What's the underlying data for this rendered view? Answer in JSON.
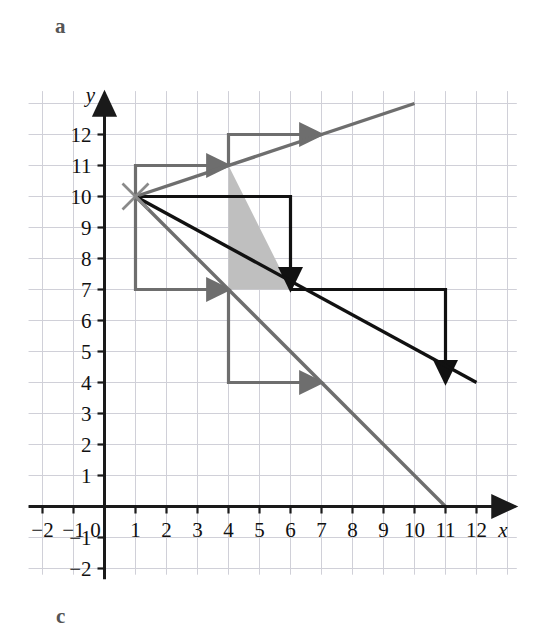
{
  "figure": {
    "panel_labels": [
      {
        "name": "a",
        "text": "a",
        "x": 55,
        "y": 14
      },
      {
        "name": "c",
        "text": "c",
        "x": 56,
        "y": 604
      }
    ],
    "axis_labels": {
      "x": "x",
      "y": "y"
    },
    "colors": {
      "grid": "#d0d0d8",
      "axis": "#1a1a1a",
      "black_line": "#111111",
      "gray_line": "#6e6e6e",
      "shade_fill": "#bfbfbf",
      "background": "#ffffff"
    }
  },
  "chart_data": {
    "type": "line",
    "title": "",
    "xlabel": "x",
    "ylabel": "y",
    "xlim": [
      -2,
      12
    ],
    "ylim": [
      -2,
      12
    ],
    "grid": true,
    "legend": "none",
    "xticks": [
      -2,
      -1,
      0,
      1,
      2,
      3,
      4,
      5,
      6,
      7,
      8,
      9,
      10,
      11,
      12
    ],
    "yticks": [
      -2,
      -1,
      0,
      1,
      2,
      3,
      4,
      5,
      6,
      7,
      8,
      9,
      10,
      11,
      12
    ],
    "xtick_labels": [
      "−2",
      "−1",
      "0",
      "1",
      "2",
      "3",
      "4",
      "5",
      "6",
      "7",
      "8",
      "9",
      "10",
      "11",
      "12"
    ],
    "ytick_labels": [
      "−2",
      "−1",
      "",
      "1",
      "2",
      "3",
      "4",
      "5",
      "6",
      "7",
      "8",
      "9",
      "10",
      "11",
      "12"
    ],
    "common_point": {
      "x": 1,
      "y": 10,
      "marker": "x-cross",
      "color": "#8a8a8a"
    },
    "series": [
      {
        "name": "gray-ascending-line",
        "color": "#6e6e6e",
        "slope": 0.3333,
        "intercept": 9.6667,
        "points": [
          [
            1,
            10
          ],
          [
            10,
            13
          ]
        ],
        "style": "solid",
        "width": 3.4
      },
      {
        "name": "black-descending-line",
        "color": "#111111",
        "slope": -0.6,
        "intercept": 10.6,
        "points": [
          [
            1,
            10
          ],
          [
            12,
            4.0
          ]
        ],
        "style": "solid",
        "width": 3.4
      },
      {
        "name": "gray-descending-line",
        "color": "#6e6e6e",
        "slope": -1,
        "intercept": 11,
        "points": [
          [
            1,
            10
          ],
          [
            11,
            0
          ]
        ],
        "style": "solid",
        "width": 3.4
      }
    ],
    "slope_indicators": [
      {
        "name": "gray-ascending-step-lower",
        "color": "#6e6e6e",
        "path": [
          [
            1,
            10
          ],
          [
            1,
            11
          ],
          [
            4,
            11
          ]
        ],
        "arrow_at_end": true,
        "run": 3,
        "rise": 1
      },
      {
        "name": "gray-ascending-step-upper",
        "color": "#6e6e6e",
        "path": [
          [
            4,
            11
          ],
          [
            4,
            12
          ],
          [
            7,
            12
          ]
        ],
        "arrow_at_end": true,
        "run": 3,
        "rise": 1
      },
      {
        "name": "gray-descending-step",
        "color": "#6e6e6e",
        "path": [
          [
            1,
            10
          ],
          [
            1,
            7
          ],
          [
            4,
            7
          ]
        ],
        "arrow_at_end": true,
        "run": 3,
        "rise": -3
      },
      {
        "name": "gray-descending-step-second",
        "color": "#6e6e6e",
        "path": [
          [
            4,
            7
          ],
          [
            4,
            4
          ],
          [
            7,
            4
          ]
        ],
        "arrow_at_end": true,
        "run": 3,
        "rise": -3
      },
      {
        "name": "black-slope-rectangle",
        "color": "#111111",
        "path": [
          [
            1,
            10
          ],
          [
            6,
            10
          ],
          [
            6,
            7
          ]
        ],
        "arrow_at_end": true,
        "run": 5,
        "rise": -3
      },
      {
        "name": "black-slope-step-second",
        "color": "#111111",
        "path": [
          [
            6,
            7
          ],
          [
            11,
            7
          ],
          [
            11,
            4
          ]
        ],
        "arrow_at_end": true,
        "run": 5,
        "rise": -3
      }
    ],
    "shaded_region": {
      "name": "shaded-triangle",
      "fill": "#bfbfbf",
      "vertices": [
        [
          4,
          11
        ],
        [
          4,
          7
        ],
        [
          6,
          7
        ]
      ]
    },
    "annotations": []
  }
}
